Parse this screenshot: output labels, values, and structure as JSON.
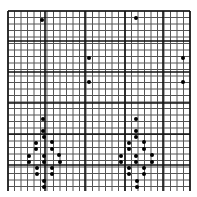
{
  "grid": {
    "left": 8,
    "top": 11,
    "right": 190,
    "bottom": 191,
    "cell": 6.5,
    "thin_color": "#555555",
    "thick_color": "#111111",
    "thick_x": [
      8,
      45,
      85,
      125,
      163,
      190
    ],
    "thick_y": [
      11,
      41,
      72,
      103,
      134,
      165
    ]
  },
  "dot_color": "#000000",
  "dot_radius": 2,
  "dots": [
    [
      42,
      20
    ],
    [
      89,
      58
    ],
    [
      89,
      82
    ],
    [
      136,
      18
    ],
    [
      183,
      58
    ],
    [
      183,
      82
    ],
    [
      43,
      119
    ],
    [
      43,
      131
    ],
    [
      44,
      137
    ],
    [
      36,
      143
    ],
    [
      52,
      142
    ],
    [
      36,
      149
    ],
    [
      52,
      149
    ],
    [
      29,
      156
    ],
    [
      44,
      156
    ],
    [
      59,
      155
    ],
    [
      29,
      162
    ],
    [
      44,
      162
    ],
    [
      60,
      162
    ],
    [
      37,
      168
    ],
    [
      52,
      168
    ],
    [
      37,
      174
    ],
    [
      52,
      174
    ],
    [
      44,
      181
    ],
    [
      44,
      187
    ],
    [
      136,
      119
    ],
    [
      136,
      131
    ],
    [
      136,
      137
    ],
    [
      129,
      143
    ],
    [
      144,
      142
    ],
    [
      129,
      149
    ],
    [
      144,
      149
    ],
    [
      121,
      156
    ],
    [
      136,
      156
    ],
    [
      152,
      155
    ],
    [
      121,
      162
    ],
    [
      136,
      162
    ],
    [
      152,
      162
    ],
    [
      129,
      168
    ],
    [
      144,
      168
    ],
    [
      129,
      174
    ],
    [
      144,
      174
    ],
    [
      137,
      181
    ],
    [
      137,
      187
    ]
  ]
}
